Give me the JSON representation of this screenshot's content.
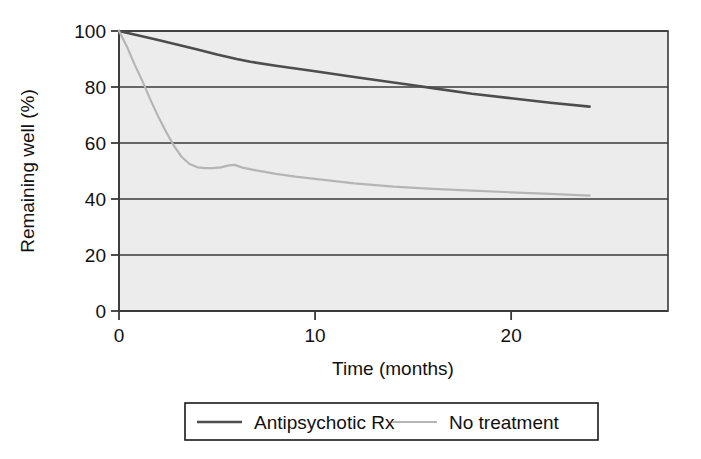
{
  "chart_data": {
    "type": "line",
    "title": "",
    "xlabel": "Time (months)",
    "ylabel": "Remaining well (%)",
    "xlim": [
      0,
      28
    ],
    "ylim": [
      0,
      100
    ],
    "xticks": [
      0,
      10,
      20
    ],
    "xtick_labels": [
      "0",
      "10",
      "20"
    ],
    "yticks": [
      0,
      20,
      40,
      60,
      80,
      100
    ],
    "ytick_labels": [
      "0",
      "20",
      "40",
      "60",
      "80",
      "100"
    ],
    "grid": "horizontal",
    "legend_position": "below-plot",
    "plot_background": "#ececec",
    "series": [
      {
        "name": "Antipsychotic Rx",
        "color": "#4d4d4d",
        "width": 2.6,
        "x": [
          0,
          1,
          2,
          3,
          4,
          5,
          6,
          6.7,
          8,
          10,
          12,
          14,
          15,
          16,
          18,
          20,
          22,
          24
        ],
        "values": [
          100,
          98.4,
          96.8,
          95.1,
          93.4,
          91.6,
          90.0,
          89.0,
          87.6,
          85.6,
          83.6,
          81.6,
          80.6,
          79.6,
          77.6,
          76.0,
          74.4,
          73.0
        ]
      },
      {
        "name": "No treatment",
        "color": "#b5b5b5",
        "width": 2.2,
        "x": [
          0,
          0.4,
          0.8,
          1.2,
          1.6,
          2.0,
          2.4,
          2.8,
          3.2,
          3.6,
          4.0,
          4.4,
          4.8,
          5.2,
          5.6,
          5.9,
          6.3,
          7,
          8,
          9,
          10,
          12,
          14,
          16,
          18,
          20,
          22,
          24
        ],
        "values": [
          100,
          94.5,
          88.0,
          82.0,
          75.5,
          69.5,
          64.0,
          59.0,
          55.0,
          52.5,
          51.3,
          51.0,
          51.0,
          51.3,
          52.0,
          52.2,
          51.2,
          50.2,
          49.0,
          48.0,
          47.2,
          45.6,
          44.4,
          43.6,
          43.0,
          42.4,
          41.8,
          41.2
        ]
      }
    ]
  },
  "legend": {
    "items": [
      {
        "label": "Antipsychotic Rx",
        "color": "#4d4d4d",
        "swatch": "solid-thick-line"
      },
      {
        "label": "No treatment",
        "color": "#b5b5b5",
        "swatch": "solid-thin-line"
      }
    ]
  }
}
